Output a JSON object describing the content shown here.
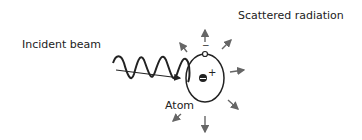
{
  "diagram": {
    "labels": {
      "incident_beam": "Incident beam",
      "scattered_radiation": "Scattered radiation",
      "atom": "Atom",
      "electron_charge": "−",
      "nucleus_charge": "+"
    },
    "colors": {
      "ink": "#222222",
      "arrow": "#666666",
      "background": "#ffffff"
    },
    "scatter_arrow_count": 8
  }
}
